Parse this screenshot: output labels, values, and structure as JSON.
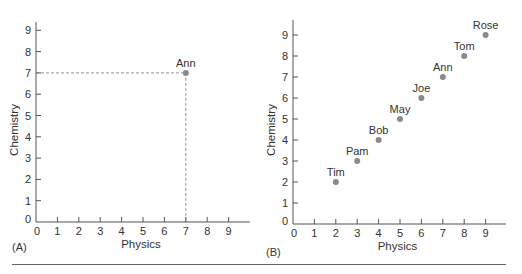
{
  "figure": {
    "panel_a_label": "(A)",
    "panel_b_label": "(B)"
  },
  "chart_data": [
    {
      "type": "scatter",
      "panel": "(A)",
      "title": "",
      "xlabel": "Physics",
      "ylabel": "Chemistry",
      "xlim": [
        0,
        9
      ],
      "ylim": [
        0,
        9
      ],
      "x_ticks": [
        0,
        1,
        2,
        3,
        4,
        5,
        6,
        7,
        8,
        9
      ],
      "y_ticks": [
        0,
        1,
        2,
        3,
        4,
        5,
        6,
        7,
        8,
        9
      ],
      "grid": false,
      "points": [
        {
          "label": "Ann",
          "x": 7,
          "y": 7
        }
      ],
      "annotations": [
        "dashed guide lines from Ann to x=7 and y=7 axes"
      ],
      "point_color": "#8a8a8a"
    },
    {
      "type": "scatter",
      "panel": "(B)",
      "title": "",
      "xlabel": "Physics",
      "ylabel": "Chemistry",
      "xlim": [
        0,
        9
      ],
      "ylim": [
        0,
        9
      ],
      "x_ticks": [
        0,
        1,
        2,
        3,
        4,
        5,
        6,
        7,
        8,
        9
      ],
      "y_ticks": [
        0,
        1,
        2,
        3,
        4,
        5,
        6,
        7,
        8,
        9
      ],
      "grid": false,
      "points": [
        {
          "label": "Tim",
          "x": 2,
          "y": 2
        },
        {
          "label": "Pam",
          "x": 3,
          "y": 3
        },
        {
          "label": "Bob",
          "x": 4,
          "y": 4
        },
        {
          "label": "May",
          "x": 5,
          "y": 5
        },
        {
          "label": "Joe",
          "x": 6,
          "y": 6
        },
        {
          "label": "Ann",
          "x": 7,
          "y": 7
        },
        {
          "label": "Tom",
          "x": 8,
          "y": 8
        },
        {
          "label": "Rose",
          "x": 9,
          "y": 9
        }
      ],
      "point_color": "#8a8a8a"
    }
  ]
}
